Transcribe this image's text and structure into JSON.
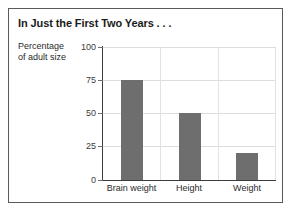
{
  "figure": {
    "title": "In Just the First Two Years . . .",
    "frame_color": "#5a5a5a",
    "background": "#ffffff"
  },
  "chart_data": {
    "type": "bar",
    "title": "In Just the First Two Years . . .",
    "categories": [
      "Brain weight",
      "Height",
      "Weight"
    ],
    "values": [
      75,
      50,
      20
    ],
    "series": [
      {
        "name": "Percentage of adult size",
        "values": [
          75,
          50,
          20
        ]
      }
    ],
    "xlabel": "",
    "ylabel": "Percentage of adult size",
    "ylabel_line1": "Percentage",
    "ylabel_line2": "of adult size",
    "ylim": [
      0,
      100
    ],
    "yticks": [
      0,
      25,
      50,
      75,
      100
    ],
    "ytick_labels": [
      "0",
      "25",
      "50",
      "75",
      "100"
    ],
    "grid": true,
    "legend": false,
    "bar_color": "#6e6e6e",
    "gridline_color": "#dddddd",
    "axis_color": "#3c3c3c"
  },
  "axis": {
    "y_tick_0": "0",
    "y_tick_25": "25",
    "y_tick_50": "50",
    "y_tick_75": "75",
    "y_tick_100": "100",
    "x_cat_0": "Brain weight",
    "x_cat_1": "Height",
    "x_cat_2": "Weight"
  }
}
